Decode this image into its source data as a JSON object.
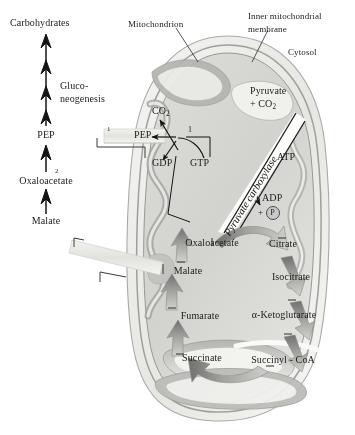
{
  "figure": {
    "title_labels": {
      "mitochondrion": "Mitochondrion",
      "inner_membrane_line1": "Inner mitochondrial",
      "inner_membrane_line2": "membrane",
      "cytosol": "Cytosol"
    },
    "cytosol_pathway": {
      "top_product": "Carbohydrates",
      "pathway_name_line1": "Gluco-",
      "pathway_name_line2": "neogenesis",
      "pep": "PEP",
      "oxaloacetate": "Oxaloacetate",
      "malate": "Malate",
      "step_label_1": "1",
      "step_label_2": "2"
    },
    "matrix": {
      "pep": "PEP",
      "co2": "CO",
      "co2_sub": "2",
      "gdp": "GDP",
      "gtp": "GTP",
      "step_label_1": "1",
      "pyruvate": "Pyruvate",
      "plus_co2": "+ CO",
      "plus_co2_sub": "2",
      "enzyme": "Pyruvate carboxylase",
      "atp": "ATP",
      "adp": "ADP",
      "adp_plus": "+",
      "phosphate": "P"
    },
    "citric_acid_cycle": [
      "Oxaloacetate",
      "Citrate",
      "Isocitrate",
      "α-Ketoglutarate",
      "Succinyl - CoA",
      "Succinate",
      "Fumarate",
      "Malate"
    ],
    "transport_bands": {
      "pep_shuttle": "pep-transport-band",
      "malate_shuttle": "malate-transport-band"
    },
    "colors": {
      "background": "#ffffff",
      "outer_membrane": "#e8e8e6",
      "inner_membrane": "#b9b9b7",
      "matrix_fill": "#d6d6d3",
      "cristae_light": "#efefec",
      "cristae_dark": "#9e9e9b",
      "arrow_grey": "#8d8d8a",
      "text": "#1c1c1c",
      "band_fill": "#e4e4e0",
      "phosphate_circle": "#c9c9c9"
    }
  }
}
